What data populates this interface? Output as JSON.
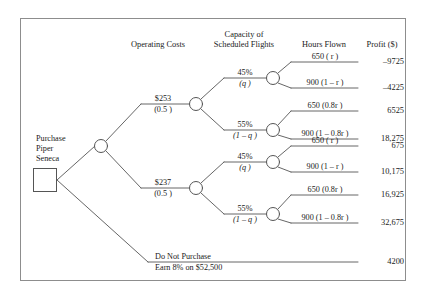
{
  "figure": {
    "type": "decision-tree",
    "border_color": "#8d8d8d",
    "line_color": "#555555",
    "background": "#ffffff"
  },
  "column_headers": {
    "operating_costs": "Operating Costs",
    "capacity_line1": "Capacity of",
    "capacity_line2": "Scheduled Flights",
    "hours_flown": "Hours Flown",
    "profit": "Profit ($)"
  },
  "root": {
    "label_line1": "Purchase",
    "label_line2": "Piper",
    "label_line3": "Seneca",
    "node_type": "decision-square"
  },
  "operating_cost_branches": [
    {
      "id": "oc-253",
      "cost": "$253",
      "prob": "(0.5 )"
    },
    {
      "id": "oc-237",
      "cost": "$237",
      "prob": "(0.5 )"
    }
  ],
  "capacity_branches": [
    {
      "id": "cap-45-a",
      "pct": "45%",
      "prob": "(q )"
    },
    {
      "id": "cap-55-a",
      "pct": "55%",
      "prob": "(1 – q )"
    },
    {
      "id": "cap-45-b",
      "pct": "45%",
      "prob": "(q )"
    },
    {
      "id": "cap-55-b",
      "pct": "55%",
      "prob": "(1 – q )"
    }
  ],
  "outcomes": [
    {
      "id": "out-1",
      "hours": "650 ( r )",
      "profit": "–9725"
    },
    {
      "id": "out-2",
      "hours": "900 (1 – r )",
      "profit": "–4225"
    },
    {
      "id": "out-3",
      "hours": "650 (0.8r )",
      "profit": "6525"
    },
    {
      "id": "out-4",
      "hours": "900 (1 – 0.8r )",
      "profit": "18,275"
    },
    {
      "id": "out-5",
      "hours": "650 ( r )",
      "profit": "675"
    },
    {
      "id": "out-6",
      "hours": "900 (1 – r )",
      "profit": "10,175"
    },
    {
      "id": "out-7",
      "hours": "650 (0.8r )",
      "profit": "16,925"
    },
    {
      "id": "out-8",
      "hours": "900 (1 – 0.8r )",
      "profit": "32,675"
    }
  ],
  "no_purchase": {
    "label_line1": "Do Not Purchase",
    "label_line2": "Earn 8% on $52,500",
    "profit": "4200"
  }
}
